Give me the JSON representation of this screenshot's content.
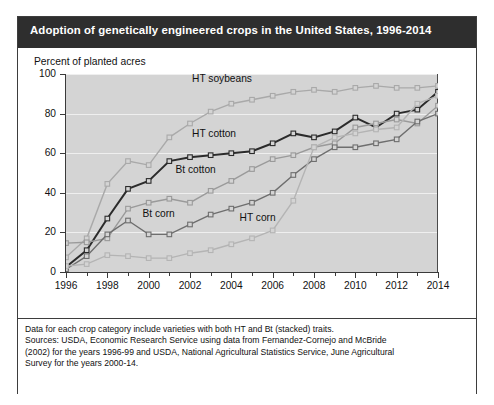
{
  "figure": {
    "title": "Adoption of genetically engineered crops in the United States, 1996-2014",
    "y_axis_label": "Percent of planted acres",
    "footnote_lines": [
      "Data for each crop category include varieties with both HT and Bt (stacked) traits.",
      "Sources: USDA, Economic Research Service using data from Fernandez-Cornejo and McBride",
      "(2002) for the years 1996-99 and USDA, National Agricultural Statistics Service, June Agricultural",
      "Survey for the years 2000-14."
    ],
    "colors": {
      "title_bar": "#2e2e2e",
      "plot_background": "#d4d4d4",
      "gridline": "#efefef",
      "axis": "#3a3a3a",
      "ht_soybeans": "#a9a9a9",
      "ht_cotton": "#2b2b2b",
      "bt_cotton": "#9a9a9a",
      "bt_corn": "#6e6e6e",
      "ht_corn": "#b4b4b4"
    }
  },
  "chart_data": {
    "type": "line",
    "title": "Adoption of genetically engineered crops in the United States, 1996-2014",
    "xlabel": "",
    "ylabel": "Percent of planted acres",
    "ylim": [
      0,
      100
    ],
    "xlim": [
      1996,
      2014
    ],
    "yticks": [
      0,
      20,
      40,
      60,
      80,
      100
    ],
    "xticks": [
      1996,
      1997,
      1998,
      1999,
      2000,
      2001,
      2002,
      2003,
      2004,
      2005,
      2006,
      2007,
      2008,
      2009,
      2010,
      2011,
      2012,
      2013,
      2014
    ],
    "xtick_labels": [
      "1996",
      "",
      "1998",
      "",
      "2000",
      "",
      "2002",
      "",
      "2004",
      "",
      "2006",
      "",
      "2008",
      "",
      "2010",
      "",
      "2012",
      "",
      "2014"
    ],
    "grid": "horizontal",
    "legend": "inline annotations",
    "marker": "open square",
    "x": [
      1996,
      1997,
      1998,
      1999,
      2000,
      2001,
      2002,
      2003,
      2004,
      2005,
      2006,
      2007,
      2008,
      2009,
      2010,
      2011,
      2012,
      2013,
      2014
    ],
    "series": [
      {
        "name": "HT soybeans",
        "color": "#a9a9a9",
        "label_position": {
          "x": 2002.1,
          "y": 97
        },
        "values": [
          7.4,
          17,
          44.5,
          56,
          54,
          68,
          75,
          81,
          85,
          87,
          89,
          91,
          92,
          91,
          93,
          94,
          93,
          93,
          94
        ]
      },
      {
        "name": "HT cotton",
        "color": "#2b2b2b",
        "label_position": {
          "x": 2002.1,
          "y": 69
        },
        "values": [
          2.5,
          11,
          27,
          42,
          46,
          56,
          58,
          59,
          60,
          61,
          65,
          70,
          68,
          71,
          78,
          73,
          80,
          82,
          91
        ]
      },
      {
        "name": "Bt cotton",
        "color": "#9a9a9a",
        "label_position": {
          "x": 2001.3,
          "y": 51
        },
        "values": [
          14.6,
          15,
          17,
          32,
          35,
          37,
          35,
          41,
          46,
          52,
          57,
          59,
          63,
          65,
          73,
          75,
          77,
          75,
          84
        ]
      },
      {
        "name": "Bt corn",
        "color": "#6e6e6e",
        "label_position": {
          "x": 1999.7,
          "y": 29
        },
        "values": [
          1.4,
          8,
          19,
          26,
          19,
          19,
          24,
          29,
          32,
          35,
          40,
          49,
          57,
          63,
          63,
          65,
          67,
          76,
          80
        ]
      },
      {
        "name": "HT corn",
        "color": "#b4b4b4",
        "label_position": {
          "x": 2004.4,
          "y": 27
        },
        "values": [
          3,
          4,
          8.5,
          8,
          7,
          7,
          9.5,
          11,
          14,
          17,
          21,
          36,
          63,
          68,
          70,
          72,
          73,
          85,
          89
        ]
      }
    ]
  }
}
